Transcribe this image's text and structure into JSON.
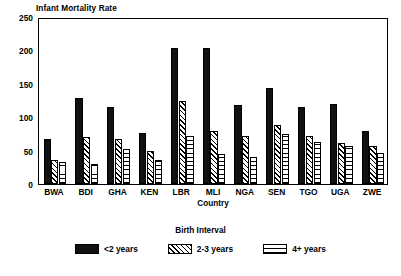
{
  "chart_data": {
    "type": "bar",
    "title": "",
    "ylabel": "Infant Mortality Rate",
    "xlabel": "Country",
    "ylim": [
      0,
      250
    ],
    "yticks": [
      0,
      50,
      100,
      150,
      200,
      250
    ],
    "grid": false,
    "legend_title": "Birth Interval",
    "legend_position": "bottom",
    "categories": [
      "BWA",
      "BDI",
      "GHA",
      "KEN",
      "LBR",
      "MLI",
      "NGA",
      "SEN",
      "TGO",
      "UGA",
      "ZWE"
    ],
    "series": [
      {
        "name": "<2 years",
        "pattern": "solid-black",
        "values": [
          67,
          129,
          116,
          76,
          204,
          203,
          118,
          143,
          115,
          120,
          79
        ]
      },
      {
        "name": "2-3 years",
        "pattern": "diagonal-hatch",
        "values": [
          36,
          70,
          68,
          49,
          124,
          80,
          72,
          88,
          72,
          62,
          57
        ]
      },
      {
        "name": "4+ years",
        "pattern": "cross-hatch",
        "values": [
          33,
          30,
          52,
          36,
          72,
          45,
          41,
          75,
          63,
          57,
          46
        ]
      }
    ]
  }
}
